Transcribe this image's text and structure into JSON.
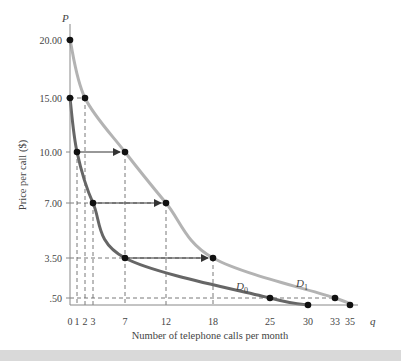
{
  "chart_data": {
    "type": "line",
    "title": "",
    "xlabel": "Number of telephone calls per month",
    "ylabel": "Price per call ($)",
    "x_axis_symbol": "q",
    "y_axis_symbol": "P",
    "xlim": [
      0,
      36
    ],
    "ylim": [
      0,
      21
    ],
    "x_ticks": [
      0,
      1,
      2,
      3,
      7,
      12,
      18,
      25,
      30,
      33,
      35
    ],
    "x_tick_labels": [
      "0",
      "1",
      "2",
      "3",
      "7",
      "12",
      "18",
      "25",
      "30",
      "33",
      "35"
    ],
    "y_ticks": [
      0.5,
      3.5,
      7,
      10,
      15,
      20
    ],
    "y_tick_labels": [
      ".50",
      "3.50",
      "7.00",
      "10.00",
      "15.00",
      "20.00"
    ],
    "grid": false,
    "series": [
      {
        "name": "D0",
        "label": "D0",
        "color": "#666666",
        "points": [
          [
            0,
            15
          ],
          [
            1,
            10
          ],
          [
            3,
            7
          ],
          [
            7,
            3.5
          ],
          [
            25,
            0.5
          ],
          [
            30,
            0
          ]
        ]
      },
      {
        "name": "D1",
        "label": "D1",
        "color": "#b3b3b3",
        "points": [
          [
            0,
            20
          ],
          [
            2,
            15
          ],
          [
            7,
            10
          ],
          [
            12,
            7
          ],
          [
            18,
            3.5
          ],
          [
            33,
            0.5
          ],
          [
            35,
            0
          ]
        ]
      }
    ],
    "shift_arrows": [
      {
        "price": 10,
        "from_q": 1,
        "to_q": 7
      },
      {
        "price": 7,
        "from_q": 3,
        "to_q": 12
      },
      {
        "price": 3.5,
        "from_q": 7,
        "to_q": 18
      }
    ],
    "dashed_guides": {
      "horizontal_prices": [
        15,
        7,
        3.5,
        0.5
      ],
      "vertical_quantities": [
        1,
        2,
        3,
        7,
        12,
        18
      ]
    },
    "annotations": [
      {
        "text": "D0",
        "q": 26,
        "p": 1.8
      },
      {
        "text": "D1",
        "q": 30,
        "p": 2.3
      }
    ]
  },
  "colors": {
    "axis": "#888888",
    "d0_curve": "#666666",
    "d1_curve": "#b3b3b3",
    "points": "#111111",
    "arrows": "#333333",
    "guides": "#555555",
    "bottom_band": "#d9d9d9"
  }
}
